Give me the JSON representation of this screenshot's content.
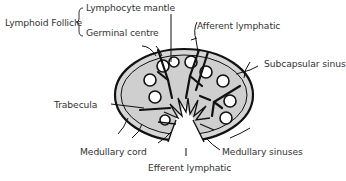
{
  "diagram": {
    "colors": {
      "outline": "#111111",
      "fill": "#d4d4d4",
      "text": "#333333",
      "background": "#ffffff"
    },
    "group_label": "Lymphoid Follicle",
    "labels": {
      "lymphocyte_mantle": "Lymphocyte mantle",
      "germinal_centre": "Germinal centre",
      "afferent_lymphatic": "Afferent lymphatic",
      "subcapsular_sinus": "Subcapsular sinus",
      "trabecula": "Trabecula",
      "medullary_cord": "Medullary cord",
      "medullary_sinuses": "Medullary sinuses",
      "efferent_lymphatic": "Efferent lymphatic"
    }
  }
}
